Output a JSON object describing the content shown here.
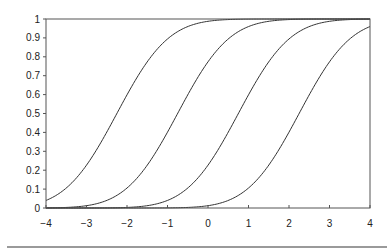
{
  "chart_data": {
    "type": "line",
    "title": "",
    "xlabel": "",
    "ylabel": "",
    "xlim": [
      -4,
      4
    ],
    "ylim": [
      0,
      1
    ],
    "grid": false,
    "legend": null,
    "x_ticks": [
      -4,
      -3,
      -2,
      -1,
      0,
      1,
      2,
      3,
      4
    ],
    "x_tick_labels": [
      "−4",
      "−3",
      "−2",
      "−1",
      "0",
      "1",
      "2",
      "3",
      "4"
    ],
    "y_ticks": [
      0,
      0.1,
      0.2,
      0.3,
      0.4,
      0.5,
      0.6,
      0.7,
      0.8,
      0.9,
      1
    ],
    "y_tick_labels": [
      "0",
      "0.1",
      "0.2",
      "0.3",
      "0.4",
      "0.5",
      "0.6",
      "0.7",
      "0.8",
      "0.9",
      "1"
    ],
    "series_description": "Four sigmoid (cumulative normal) curves with identical shape shifted along x",
    "series": [
      {
        "name": "curve-1",
        "center": -2.25,
        "scale": 1.0,
        "color": "#333333",
        "x": [
          -4,
          -3,
          -2,
          -1,
          0,
          1,
          2,
          3,
          4
        ],
        "values": [
          0.04,
          0.23,
          0.6,
          0.89,
          0.99,
          1.0,
          1.0,
          1.0,
          1.0
        ]
      },
      {
        "name": "curve-2",
        "center": -0.75,
        "scale": 1.0,
        "color": "#333333",
        "x": [
          -4,
          -3,
          -2,
          -1,
          0,
          1,
          2,
          3,
          4
        ],
        "values": [
          0.0,
          0.01,
          0.11,
          0.4,
          0.77,
          0.96,
          1.0,
          1.0,
          1.0
        ]
      },
      {
        "name": "curve-3",
        "center": 0.75,
        "scale": 1.0,
        "color": "#333333",
        "x": [
          -4,
          -3,
          -2,
          -1,
          0,
          1,
          2,
          3,
          4
        ],
        "values": [
          0.0,
          0.0,
          0.0,
          0.04,
          0.23,
          0.6,
          0.89,
          0.99,
          1.0
        ]
      },
      {
        "name": "curve-4",
        "center": 2.25,
        "scale": 1.0,
        "color": "#333333",
        "x": [
          -4,
          -3,
          -2,
          -1,
          0,
          1,
          2,
          3,
          4
        ],
        "values": [
          0.0,
          0.0,
          0.0,
          0.0,
          0.01,
          0.11,
          0.4,
          0.77,
          0.96
        ]
      }
    ]
  },
  "layout": {
    "plot_left": 46,
    "plot_top": 19,
    "plot_right": 370,
    "plot_bottom": 208,
    "axis_color": "#555555",
    "separator_color": "#9a9a9a"
  }
}
